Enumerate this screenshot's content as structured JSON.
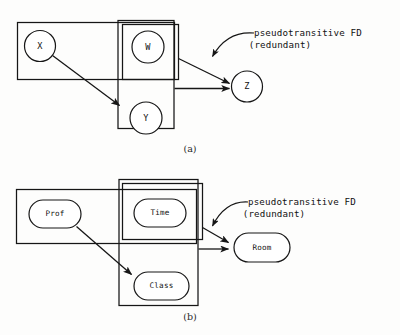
{
  "figure": {
    "background_color": "#fdfdfc",
    "ink_color": "#161616",
    "panels": [
      {
        "id": "a",
        "caption": "(a)",
        "annotation": {
          "line1": "pseudotransitive FD",
          "line2": "(redundant)"
        },
        "node_shape": "circle",
        "nodes": [
          {
            "id": "x",
            "label": "X"
          },
          {
            "id": "w",
            "label": "W"
          },
          {
            "id": "y",
            "label": "Y"
          },
          {
            "id": "z",
            "label": "Z"
          }
        ],
        "determinant_groups": [
          {
            "id": "group-xw",
            "members": [
              "X",
              "W"
            ]
          },
          {
            "id": "group-wy",
            "members": [
              "W",
              "Y"
            ]
          },
          {
            "id": "group-w",
            "members": [
              "W"
            ]
          }
        ],
        "edges": [
          {
            "id": "edge-x-y",
            "from": "X",
            "to": "Y",
            "kind": "dependency"
          },
          {
            "id": "edge-w-z",
            "from": "W",
            "to": "Z",
            "kind": "pseudotransitive-redundant"
          },
          {
            "id": "edge-wy-z",
            "from": "WY",
            "to": "Z",
            "kind": "dependency"
          }
        ]
      },
      {
        "id": "b",
        "caption": "(b)",
        "annotation": {
          "line1": "pseudotransitive FD",
          "line2": "(redundant)"
        },
        "node_shape": "stadium",
        "nodes": [
          {
            "id": "prof",
            "label": "Prof"
          },
          {
            "id": "time",
            "label": "Time"
          },
          {
            "id": "class",
            "label": "Class"
          },
          {
            "id": "room",
            "label": "Room"
          }
        ],
        "determinant_groups": [
          {
            "id": "group-prof-time",
            "members": [
              "Prof",
              "Time"
            ]
          },
          {
            "id": "group-time-class",
            "members": [
              "Time",
              "Class"
            ]
          },
          {
            "id": "group-time",
            "members": [
              "Time"
            ]
          }
        ],
        "edges": [
          {
            "id": "edge-prof-class",
            "from": "Prof",
            "to": "Class",
            "kind": "dependency"
          },
          {
            "id": "edge-time-room",
            "from": "Time",
            "to": "Room",
            "kind": "pseudotransitive-redundant"
          },
          {
            "id": "edge-timeclass-room",
            "from": "TimeClass",
            "to": "Room",
            "kind": "dependency"
          }
        ]
      }
    ]
  }
}
